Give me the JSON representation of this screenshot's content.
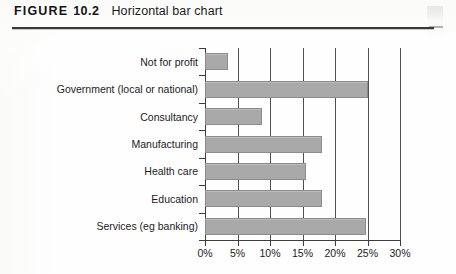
{
  "caption": {
    "figure_word": "FIGURE",
    "figure_number": "10.2",
    "title": "Horizontal bar chart"
  },
  "colors": {
    "bar_fill": "#a9a9a9",
    "bar_stroke": "#8c8c8c",
    "axis": "#3c3c3c",
    "gridline": "#4f4f4f",
    "text": "#1c1c1c"
  },
  "chart_data": {
    "type": "bar",
    "orientation": "horizontal",
    "title": "Horizontal bar chart",
    "xlabel": "",
    "ylabel": "",
    "xlim": [
      0,
      30
    ],
    "grid": true,
    "legend_position": "none",
    "categories": [
      "Not for profit",
      "Government (local or national)",
      "Consultancy",
      "Manufacturing",
      "Health care",
      "Education",
      "Services (eg banking)"
    ],
    "values": [
      3.5,
      25.0,
      8.8,
      18.0,
      15.5,
      18.0,
      24.8
    ],
    "value_unit": "%",
    "tick_labels": [
      "0%",
      "5%",
      "10%",
      "15%",
      "20%",
      "25%",
      "30%"
    ],
    "tick_values": [
      0,
      5,
      10,
      15,
      20,
      25,
      30
    ]
  }
}
